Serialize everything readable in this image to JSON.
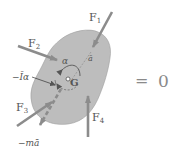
{
  "diagram": {
    "type": "kinetic-diagram",
    "body": {
      "label": "G",
      "fill": "#bdbdbd",
      "stroke": "#9a9a9a"
    },
    "forces": [
      {
        "id": "F1",
        "label": "F",
        "subscript": "1"
      },
      {
        "id": "F2",
        "label": "F",
        "subscript": "2"
      },
      {
        "id": "F3",
        "label": "F",
        "subscript": "3"
      },
      {
        "id": "F4",
        "label": "F",
        "subscript": "4"
      }
    ],
    "inertia": {
      "moment_label": "−Īα",
      "force_label": "−mā",
      "angular_accel_label": "α",
      "linear_accel_label": "ā"
    },
    "equation": {
      "equals": "=",
      "rhs": "0"
    },
    "colors": {
      "arrow": "#8c8c8c",
      "text": "#555555",
      "body": "#bdbdbd"
    }
  }
}
